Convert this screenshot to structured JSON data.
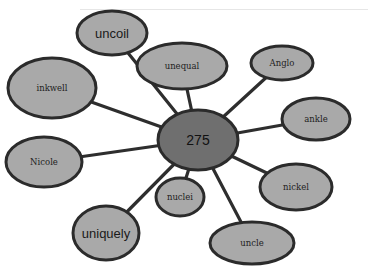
{
  "diagram": {
    "type": "spider-map",
    "center": {
      "label": "275",
      "cx": 198,
      "cy": 140,
      "rx": 40,
      "ry": 30
    },
    "nodes": [
      {
        "label": "uncoil",
        "cx": 112,
        "cy": 33,
        "rx": 35,
        "ry": 22,
        "style": "sans"
      },
      {
        "label": "unequal",
        "cx": 182,
        "cy": 66,
        "rx": 45,
        "ry": 23,
        "style": "serif"
      },
      {
        "label": "Anglo",
        "cx": 282,
        "cy": 63,
        "rx": 31,
        "ry": 17,
        "style": "serif"
      },
      {
        "label": "inkwell",
        "cx": 52,
        "cy": 88,
        "rx": 44,
        "ry": 30,
        "style": "serif"
      },
      {
        "label": "ankle",
        "cx": 316,
        "cy": 119,
        "rx": 34,
        "ry": 21,
        "style": "serif"
      },
      {
        "label": "Nicole",
        "cx": 44,
        "cy": 162,
        "rx": 38,
        "ry": 25,
        "style": "serif"
      },
      {
        "label": "nickel",
        "cx": 296,
        "cy": 187,
        "rx": 36,
        "ry": 23,
        "style": "serif"
      },
      {
        "label": "nuclei",
        "cx": 180,
        "cy": 197,
        "rx": 24,
        "ry": 19,
        "style": "serif"
      },
      {
        "label": "uniquely",
        "cx": 106,
        "cy": 233,
        "rx": 33,
        "ry": 27,
        "style": "sans"
      },
      {
        "label": "uncle",
        "cx": 252,
        "cy": 243,
        "rx": 42,
        "ry": 21,
        "style": "serif"
      }
    ],
    "colors": {
      "node_fill": "#a9a9a9",
      "center_fill": "#6f6f6f",
      "stroke": "#2b2b2b",
      "background": "#ffffff"
    }
  }
}
